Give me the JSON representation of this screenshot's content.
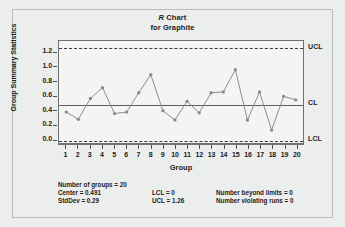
{
  "chart_data": {
    "type": "line",
    "title": "R Chart",
    "subtitle": "for Graphite",
    "title_prefix_italic": "R",
    "title_rest": " Chart",
    "xlabel": "Group",
    "ylabel": "Group Summary Statistics",
    "categories": [
      1,
      2,
      3,
      4,
      5,
      6,
      7,
      8,
      9,
      10,
      11,
      12,
      13,
      14,
      15,
      16,
      17,
      18,
      19,
      20
    ],
    "x_tick_labels": [
      "1",
      "2",
      "3",
      "4",
      "5",
      "6",
      "7",
      "8",
      "9",
      "10",
      "11",
      "12",
      "13",
      "14",
      "15",
      "16",
      "17",
      "18",
      "19",
      "20"
    ],
    "values": [
      0.37,
      0.27,
      0.56,
      0.71,
      0.35,
      0.37,
      0.64,
      0.89,
      0.39,
      0.26,
      0.52,
      0.36,
      0.64,
      0.65,
      0.96,
      0.26,
      0.65,
      0.12,
      0.59,
      0.54
    ],
    "y_tick_labels": [
      "0.0",
      "0.2",
      "0.4",
      "0.6",
      "0.8",
      "1.0",
      "1.2"
    ],
    "y_tick_values": [
      0.0,
      0.2,
      0.4,
      0.6,
      0.8,
      1.0,
      1.2
    ],
    "ylim": [
      -0.06,
      1.36
    ],
    "xlim": [
      0.4,
      20.6
    ],
    "grid": false,
    "legend": "none",
    "control_lines": [
      {
        "name": "UCL",
        "label": "UCL",
        "value": 1.26,
        "style": "dashed"
      },
      {
        "name": "CL",
        "label": "CL",
        "value": 0.491,
        "style": "solid"
      },
      {
        "name": "LCL",
        "label": "LCL",
        "value": 0.0,
        "style": "dashed"
      }
    ],
    "series_color": "#8a8c8e",
    "marker": "circle"
  },
  "footer": {
    "number_of_groups": "Number of groups = 20",
    "center": "Center = 0.491",
    "stddev": "StdDev = 0.29",
    "lcl": "LCL = 0",
    "ucl": "UCL = 1.26",
    "beyond_limits": "Number beyond limits = 0",
    "violating_runs": "Number violating runs = 0"
  }
}
